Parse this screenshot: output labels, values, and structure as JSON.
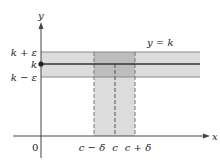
{
  "diagram": {
    "axes": {
      "x_label": "x",
      "y_label": "y",
      "origin_label": "0"
    },
    "horizontal_band": {
      "upper_label": "k + ε",
      "center_label": "k",
      "lower_label": "k − ε",
      "line_label": "y = k"
    },
    "vertical_band": {
      "left_label": "c − δ",
      "center_label": "c",
      "right_label": "c + δ"
    },
    "colors": {
      "band_fill": "#dcdcdc",
      "overlap_fill": "#bdbdbd",
      "line": "#333333",
      "axis": "#444444"
    }
  }
}
